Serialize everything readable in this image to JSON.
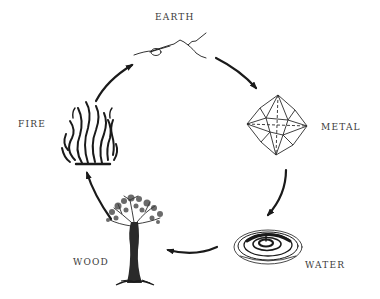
{
  "diagram": {
    "type": "cycle",
    "direction": "clockwise",
    "nodes": [
      {
        "id": "earth",
        "label": "EARTH",
        "icon": "mountain-icon"
      },
      {
        "id": "metal",
        "label": "METAL",
        "icon": "crystal-icon"
      },
      {
        "id": "water",
        "label": "WATER",
        "icon": "ripple-icon"
      },
      {
        "id": "wood",
        "label": "WOOD",
        "icon": "tree-icon"
      },
      {
        "id": "fire",
        "label": "FIRE",
        "icon": "flame-icon"
      }
    ],
    "edges": [
      {
        "from": "earth",
        "to": "metal"
      },
      {
        "from": "metal",
        "to": "water"
      },
      {
        "from": "water",
        "to": "wood"
      },
      {
        "from": "wood",
        "to": "fire"
      },
      {
        "from": "fire",
        "to": "earth"
      }
    ],
    "colors": {
      "ink": "#1a1a1a",
      "label": "#3a3a3a",
      "background": "#ffffff"
    }
  }
}
